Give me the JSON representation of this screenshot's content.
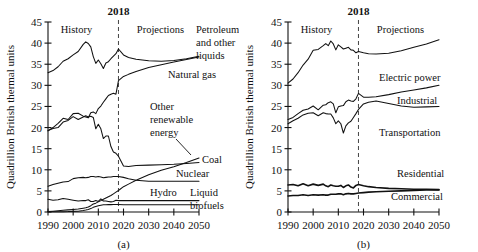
{
  "figure": {
    "axis_title": "Quadrillion British thermal units",
    "era_history": "History",
    "era_projections": "Projections",
    "divider_year": "2018",
    "y_ticks": [
      "0",
      "5",
      "10",
      "15",
      "20",
      "25",
      "30",
      "35",
      "40",
      "45"
    ],
    "x_ticks": [
      "1990",
      "2000",
      "2010",
      "2020",
      "2030",
      "2040",
      "2050"
    ],
    "panel_a_caption": "(a)",
    "panel_b_caption": "(b)"
  },
  "chart_data": [
    {
      "type": "line",
      "id": "panel-a",
      "title": "",
      "caption": "(a)",
      "xlabel": "",
      "ylabel": "Quadrillion British thermal units",
      "xlim": [
        1990,
        2050
      ],
      "ylim": [
        0,
        45
      ],
      "grid": false,
      "legend": "inline-labels",
      "annotations": [
        "History",
        "Projections",
        "2018"
      ],
      "divider_x": 2018,
      "x": [
        1990,
        1992,
        1994,
        1996,
        1998,
        2000,
        2002,
        2004,
        2005,
        2006,
        2007,
        2008,
        2009,
        2010,
        2011,
        2012,
        2013,
        2014,
        2015,
        2016,
        2017,
        2018,
        2020,
        2022,
        2025,
        2030,
        2035,
        2040,
        2045,
        2050
      ],
      "series": [
        {
          "name": "Petroleum and other liquids",
          "values": [
            33.0,
            33.5,
            34.4,
            35.7,
            36.3,
            37.2,
            38.0,
            39.7,
            40.3,
            39.9,
            39.1,
            36.8,
            35.2,
            36.0,
            35.1,
            34.0,
            35.3,
            35.6,
            36.3,
            36.9,
            37.5,
            38.6,
            37.2,
            36.6,
            36.2,
            35.8,
            35.7,
            35.9,
            36.3,
            36.9
          ]
        },
        {
          "name": "Natural gas",
          "values": [
            19.2,
            20.0,
            21.0,
            22.2,
            21.9,
            23.3,
            23.4,
            22.7,
            22.5,
            22.3,
            23.5,
            23.7,
            23.3,
            24.5,
            25.1,
            26.0,
            26.8,
            27.6,
            27.9,
            28.1,
            27.9,
            31.1,
            32.1,
            32.6,
            33.3,
            34.2,
            34.9,
            35.5,
            36.1,
            36.7
          ]
        },
        {
          "name": "Coal",
          "values": [
            19.3,
            19.8,
            20.0,
            21.3,
            21.7,
            22.6,
            21.9,
            22.5,
            22.8,
            22.5,
            22.7,
            22.4,
            19.7,
            20.8,
            19.7,
            17.4,
            18.0,
            18.0,
            15.5,
            14.2,
            13.9,
            13.2,
            10.9,
            10.8,
            11.0,
            11.1,
            11.2,
            11.3,
            11.5,
            11.7
          ]
        },
        {
          "name": "Nuclear",
          "values": [
            6.1,
            6.5,
            6.8,
            7.1,
            7.2,
            7.9,
            8.1,
            8.2,
            8.1,
            8.2,
            8.4,
            8.4,
            8.3,
            8.4,
            8.3,
            8.1,
            8.2,
            8.3,
            8.3,
            8.4,
            8.4,
            8.4,
            8.2,
            7.9,
            7.5,
            7.3,
            7.3,
            7.3,
            7.3,
            7.3
          ]
        },
        {
          "name": "Other renewable energy",
          "values": [
            0.1,
            0.2,
            0.3,
            0.4,
            0.5,
            0.6,
            0.7,
            0.9,
            1.0,
            1.2,
            1.5,
            1.9,
            2.1,
            2.4,
            2.7,
            3.0,
            3.3,
            3.6,
            3.9,
            4.3,
            4.7,
            5.1,
            6.0,
            6.6,
            7.5,
            8.8,
            9.9,
            10.7,
            11.7,
            12.8
          ]
        },
        {
          "name": "Hydro",
          "values": [
            3.0,
            2.8,
            2.9,
            3.2,
            3.0,
            2.8,
            2.6,
            2.7,
            2.7,
            2.9,
            2.5,
            2.5,
            2.7,
            2.5,
            3.1,
            2.6,
            2.6,
            2.5,
            2.4,
            2.5,
            2.8,
            2.7,
            2.7,
            2.7,
            2.7,
            2.7,
            2.7,
            2.7,
            2.7,
            2.7
          ]
        },
        {
          "name": "Liquid biofuels",
          "values": [
            0.05,
            0.06,
            0.08,
            0.08,
            0.1,
            0.15,
            0.2,
            0.35,
            0.45,
            0.6,
            0.8,
            1.1,
            1.3,
            1.5,
            1.6,
            1.7,
            1.7,
            1.75,
            1.75,
            1.8,
            1.8,
            1.8,
            1.7,
            1.7,
            1.7,
            1.7,
            1.7,
            1.7,
            1.7,
            1.7
          ]
        }
      ]
    },
    {
      "type": "line",
      "id": "panel-b",
      "title": "",
      "caption": "(b)",
      "xlabel": "",
      "ylabel": "Quadrillion British thermal units",
      "xlim": [
        1990,
        2050
      ],
      "ylim": [
        0,
        45
      ],
      "grid": false,
      "legend": "inline-labels",
      "annotations": [
        "History",
        "Projections",
        "2018"
      ],
      "divider_x": 2018,
      "x": [
        1990,
        1992,
        1994,
        1996,
        1998,
        2000,
        2002,
        2004,
        2005,
        2006,
        2007,
        2008,
        2009,
        2010,
        2011,
        2012,
        2013,
        2014,
        2015,
        2016,
        2017,
        2018,
        2020,
        2022,
        2025,
        2030,
        2035,
        2040,
        2045,
        2050
      ],
      "series": [
        {
          "name": "Electric power",
          "values": [
            30.5,
            31.5,
            33.0,
            34.8,
            36.2,
            38.3,
            38.5,
            39.4,
            39.9,
            39.4,
            40.5,
            39.8,
            38.4,
            39.6,
            39.1,
            38.6,
            38.8,
            39.0,
            38.4,
            38.3,
            37.7,
            38.0,
            37.7,
            37.5,
            37.4,
            37.6,
            38.2,
            39.0,
            39.8,
            40.8
          ]
        },
        {
          "name": "Industrial",
          "values": [
            21.9,
            22.4,
            23.3,
            24.1,
            24.4,
            25.1,
            24.2,
            25.3,
            25.4,
            25.9,
            26.1,
            25.6,
            23.5,
            24.9,
            25.1,
            25.2,
            26.1,
            26.5,
            26.3,
            26.2,
            26.8,
            28.1,
            27.2,
            27.2,
            27.3,
            27.8,
            28.4,
            28.9,
            29.4,
            30.0
          ]
        },
        {
          "name": "Transportation",
          "values": [
            20.9,
            21.6,
            22.2,
            23.0,
            23.4,
            23.5,
            22.8,
            23.5,
            23.3,
            23.2,
            23.2,
            22.3,
            20.9,
            21.6,
            20.9,
            18.7,
            20.4,
            21.1,
            21.5,
            22.4,
            23.3,
            24.3,
            25.6,
            26.0,
            26.3,
            25.7,
            25.1,
            24.8,
            24.9,
            25.0
          ]
        },
        {
          "name": "Residential",
          "values": [
            6.4,
            6.5,
            6.2,
            6.7,
            6.2,
            6.6,
            6.3,
            6.6,
            6.2,
            6.0,
            6.4,
            6.2,
            6.1,
            6.1,
            6.3,
            5.8,
            6.2,
            6.4,
            5.9,
            5.7,
            6.3,
            6.5,
            6.2,
            6.0,
            5.8,
            5.6,
            5.5,
            5.4,
            5.4,
            5.3
          ]
        },
        {
          "name": "Commercial",
          "values": [
            3.8,
            3.9,
            3.9,
            4.1,
            3.9,
            4.1,
            4.0,
            4.1,
            4.0,
            4.0,
            4.2,
            4.2,
            4.2,
            4.3,
            4.3,
            4.1,
            4.3,
            4.4,
            4.3,
            4.3,
            4.4,
            4.5,
            4.6,
            4.7,
            4.8,
            4.9,
            5.0,
            5.1,
            5.2,
            5.2
          ]
        }
      ]
    }
  ],
  "panel_a_labels": {
    "petroleum_l1": "Petroleum",
    "petroleum_l2": "and other",
    "petroleum_l3": "liquids",
    "natural_gas": "Natural gas",
    "other_renewable_l1": "Other",
    "other_renewable_l2": "renewable",
    "other_renewable_l3": "energy",
    "coal": "Coal",
    "nuclear": "Nuclear",
    "hydro": "Hydro",
    "biofuels_l1": "Liquid",
    "biofuels_l2": "biofuels"
  },
  "panel_b_labels": {
    "electric_power": "Electric power",
    "industrial": "Industrial",
    "transportation": "Transportation",
    "residential": "Residential",
    "commercial": "Commercial"
  }
}
